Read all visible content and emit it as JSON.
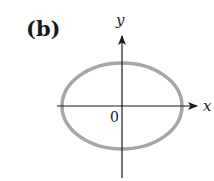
{
  "figure": {
    "panel_label": "(b)",
    "x_axis_label": "x",
    "y_axis_label": "y",
    "origin_label": "0",
    "curve": {
      "shape": "ellipse",
      "center": [
        0,
        0
      ],
      "semi_axis_x": 60,
      "semi_axis_y": 43,
      "stroke_color": "#a6a6a6"
    },
    "axis_color": "#1a1a1a"
  }
}
